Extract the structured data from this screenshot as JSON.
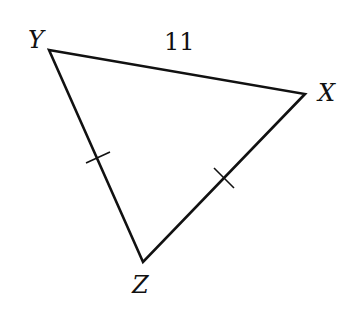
{
  "diagram": {
    "type": "triangle",
    "vertices": {
      "Y": {
        "label": "Y",
        "x": 49,
        "y": 50
      },
      "X": {
        "label": "X",
        "x": 305,
        "y": 94
      },
      "Z": {
        "label": "Z",
        "x": 143,
        "y": 262
      }
    },
    "side_labels": {
      "YX": "11"
    },
    "congruence_marks": [
      "YZ",
      "XZ"
    ],
    "stroke_color": "#111111"
  }
}
